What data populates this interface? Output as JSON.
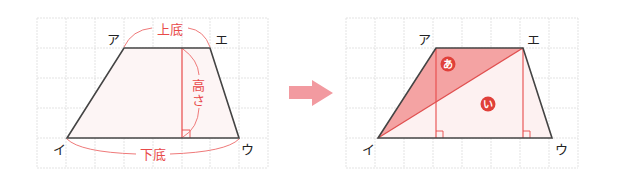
{
  "diagram": {
    "type": "trapezoid-area-explanation",
    "colors": {
      "grid": "#d8d8d8",
      "outline": "#444444",
      "accent": "#e84a4a",
      "fill_a": "#f4a6a6",
      "fill_trap": "#fdf2f2",
      "fill_b": "#fdecec",
      "arrow": "#f29aa0",
      "badge": "#e0403a"
    },
    "left_panel": {
      "vertices": {
        "top_left": "ア",
        "top_right": "エ",
        "bottom_left": "イ",
        "bottom_right": "ウ"
      },
      "labels": {
        "upper_base": "上底",
        "lower_base": "下底",
        "height": "高さ",
        "height_char1": "高",
        "height_char2": "さ"
      }
    },
    "arrow": {
      "direction": "right"
    },
    "right_panel": {
      "vertices": {
        "top_left": "ア",
        "top_right": "エ",
        "bottom_left": "イ",
        "bottom_right": "ウ"
      },
      "regions": [
        {
          "label": "あ",
          "shape": "triangle ア-イ-エ",
          "shaded": true
        },
        {
          "label": "い",
          "shape": "triangle イ-ウ-エ",
          "shaded": false
        }
      ]
    }
  }
}
